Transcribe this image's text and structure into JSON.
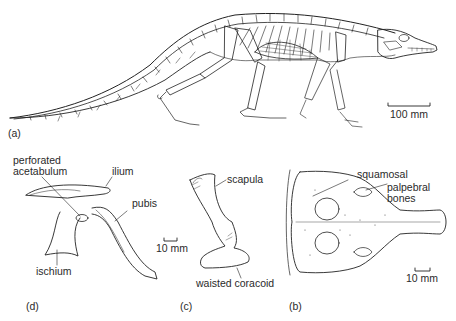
{
  "figure": {
    "panels": [
      {
        "id": "a",
        "label": "(a)",
        "subject": "full skeleton, lateral view",
        "scale": "100 mm"
      },
      {
        "id": "b",
        "label": "(b)",
        "subject": "skull, dorsal view",
        "scale": "10 mm"
      },
      {
        "id": "c",
        "label": "(c)",
        "subject": "shoulder girdle",
        "scale": "10 mm"
      },
      {
        "id": "d",
        "label": "(d)",
        "subject": "pelvic girdle",
        "scale": "10 mm"
      }
    ],
    "labels": {
      "perforated_acetabulum_1": "perforated",
      "perforated_acetabulum_2": "acetabulum",
      "ilium": "ilium",
      "pubis": "pubis",
      "ischium": "ischium",
      "scapula": "scapula",
      "waisted_coracoid": "waisted coracoid",
      "squamosal": "squamosal",
      "palpebral_1": "palpebral",
      "palpebral_2": "bones"
    },
    "scale_bars": {
      "a": "100 mm",
      "d": "10 mm",
      "b": "10 mm"
    }
  }
}
